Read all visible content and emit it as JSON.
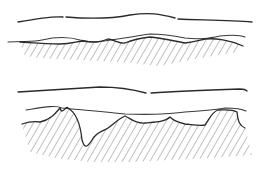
{
  "diagram": {
    "colors": {
      "line": "#2a2a2a",
      "hatch": "#555555",
      "background": "#ffffff"
    },
    "panels": [
      {
        "id": "top",
        "upper_line": "M18,22 C40,18 55,16 63,17 M66,17 C90,19 110,19 130,15 C150,12 160,14 175,18 M178,19 C200,20 230,20 252,22",
        "middle_line": "M8,42 C25,41 35,42 42,40 C55,37 70,37 80,40 C95,43 100,42 110,40 C130,38 140,35 150,34 C165,34 175,36 185,38 C200,40 210,38 220,36 C230,35 240,35 245,37",
        "surface_line": "M20,42 C35,43 45,44 60,44 C70,44 75,42 82,41 C95,43 100,42 108,39 C115,40 120,44 125,43 C132,40 140,38 150,37 C160,38 170,40 185,43 C195,42 200,40 205,39 C215,38 230,40 243,46",
        "hatch_region": "M20,42 C35,43 45,44 60,44 C70,44 75,42 82,41 C95,43 100,42 108,39 C115,40 120,44 125,43 C132,40 140,38 150,37 C160,38 170,40 185,43 C195,42 200,40 205,39 C215,38 230,40 243,46 L238,52 L200,58 L160,66 L120,62 L80,60 L40,58 L25,56 Z"
      },
      {
        "id": "bottom",
        "upper_line": "M18,92 C50,90 80,88 100,87 C120,87 135,90 146,93 M151,93 C180,91 210,90 240,89 C244,89 246,90 247,91",
        "middle_line": "M26,110 C45,107 55,105 62,108 C80,110 100,111 125,114 C150,115 170,114 185,112 C200,111 215,110 225,108 C235,108 242,109 246,111",
        "surface_line": "M22,124 C28,122 35,121 40,122 C50,120 55,114 60,108 C62,116 66,105 68,108 C75,112 80,120 82,140 C85,150 88,146 92,140 C96,132 102,132 108,128 C114,124 118,119 125,116 C130,118 135,124 145,123 C155,122 165,122 170,117 C173,120 176,122 185,124 C195,125 200,126 205,125 C210,118 212,112 218,110 C225,110 232,109 237,112 C238,122 240,126 245,128",
        "hatch_region": "M22,124 C28,122 35,121 40,122 C50,120 55,114 60,108 C62,116 66,105 68,108 C75,112 80,120 82,140 C85,150 88,146 92,140 C96,132 102,132 108,128 C114,124 118,119 125,116 C130,118 135,124 145,123 C155,122 165,122 170,117 C173,120 176,122 185,124 C195,125 200,126 205,125 C210,118 212,112 218,110 C225,110 232,109 237,112 C238,122 240,126 245,128 L252,155 L210,158 L170,160 L130,162 L90,162 L55,158 L30,152 Z"
      }
    ]
  }
}
